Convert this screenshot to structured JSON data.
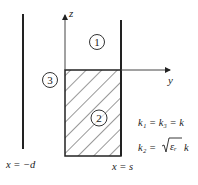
{
  "diagram": {
    "axes": {
      "z_label": "z",
      "y_label": "y"
    },
    "regions": [
      {
        "id": "1",
        "label": "1"
      },
      {
        "id": "2",
        "label": "2",
        "filled": "hatched"
      },
      {
        "id": "3",
        "label": "3"
      }
    ],
    "boundaries": {
      "left": "x = −d",
      "right": "x = s"
    },
    "equations": {
      "eq1": "k₁ = k₃ = k",
      "eq2_lhs": "k₂ =",
      "eq2_rad": "εᵣ",
      "eq2_tail": "k"
    },
    "colors": {
      "line": "#222222",
      "background": "#ffffff"
    }
  }
}
